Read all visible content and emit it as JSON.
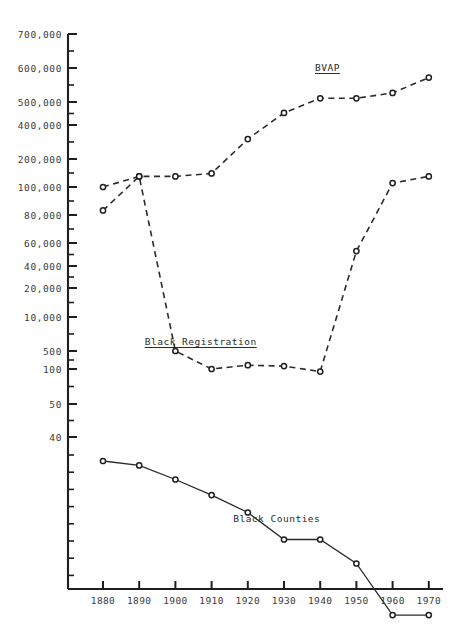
{
  "chart_data": {
    "type": "line",
    "title": "",
    "xlabel": "",
    "ylabel": "",
    "x": [
      1880,
      1890,
      1900,
      1910,
      1920,
      1930,
      1940,
      1950,
      1960,
      1970
    ],
    "x_tick_labels": [
      "1880",
      "1890",
      "1900",
      "1910",
      "1920",
      "1930",
      "1940",
      "1950",
      "1960",
      "1970"
    ],
    "y_tick_labels": [
      "700,000",
      "600,000",
      "500,000",
      "400,000",
      "200,000",
      "100,000",
      "80,000",
      "60,000",
      "40,000",
      "20,000",
      "10,000",
      "500",
      "100",
      "50",
      "40"
    ],
    "y_axis_note": "non-linear compressed scale; minor ticks between labeled values",
    "grid": false,
    "legend": "inline annotations at curves",
    "series": [
      {
        "name": "BVAP",
        "label": "BVAP",
        "label_underlined": true,
        "line_style": "dashed",
        "marker": "open-circle",
        "values": [
          100000,
          130000,
          130000,
          140000,
          300000,
          450000,
          510000,
          510000,
          525000,
          570000
        ]
      },
      {
        "name": "Black Registration",
        "label": "Black Registration",
        "label_underlined": true,
        "line_style": "dashed",
        "marker": "open-circle",
        "values": [
          83000,
          130000,
          500,
          100,
          140,
          130,
          95,
          52000,
          110000,
          130000
        ]
      },
      {
        "name": "Black Counties",
        "label": "Black Counties",
        "label_underlined": false,
        "line_style": "solid",
        "marker": "open-circle",
        "values": [
          34,
          33,
          30,
          27,
          24,
          20,
          20,
          17,
          12,
          12
        ]
      }
    ],
    "annotations": [
      {
        "text": "BVAP",
        "x": 1942,
        "y_px": 62
      },
      {
        "text": "Black Registration",
        "x": 1907,
        "y_px": 336
      },
      {
        "text": "Black Counties",
        "x": 1928,
        "y_px": 513
      }
    ]
  },
  "axis": {
    "color": "#1f1f1f",
    "series_color": "#2b2b2b"
  }
}
